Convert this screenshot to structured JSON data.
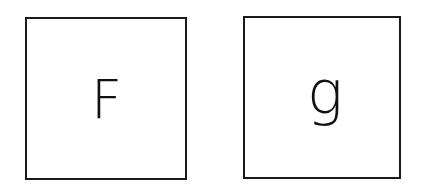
{
  "cards": [
    {
      "letter": "F"
    },
    {
      "letter": "g"
    }
  ]
}
